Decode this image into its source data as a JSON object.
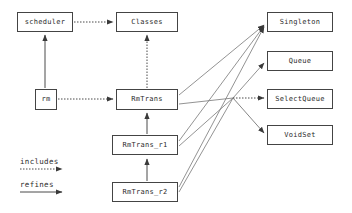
{
  "diagram": {
    "background_color": "#ffffff",
    "line_color": "#4a4a4a",
    "box_border_color": "#444444",
    "text_color": "#2b2b2b",
    "nodes": [
      {
        "id": "scheduler",
        "label": "scheduler",
        "x": 17,
        "y": 12,
        "w": 56,
        "h": 20
      },
      {
        "id": "classes",
        "label": "Classes",
        "x": 116,
        "y": 12,
        "w": 62,
        "h": 20
      },
      {
        "id": "singleton",
        "label": "Singleton",
        "x": 267,
        "y": 12,
        "w": 66,
        "h": 20
      },
      {
        "id": "queue",
        "label": "Queue",
        "x": 267,
        "y": 51,
        "w": 66,
        "h": 20
      },
      {
        "id": "selectqueue",
        "label": "SelectQueue",
        "x": 267,
        "y": 89,
        "w": 66,
        "h": 20
      },
      {
        "id": "voidset",
        "label": "VoidSet",
        "x": 267,
        "y": 125,
        "w": 66,
        "h": 20
      },
      {
        "id": "rm",
        "label": "rm",
        "x": 35,
        "y": 89,
        "w": 22,
        "h": 21
      },
      {
        "id": "rmtrans",
        "label": "RmTrans",
        "x": 116,
        "y": 89,
        "w": 62,
        "h": 21
      },
      {
        "id": "rmtrans_r1",
        "label": "RmTrans_r1",
        "x": 112,
        "y": 135,
        "w": 66,
        "h": 20
      },
      {
        "id": "rmtrans_r2",
        "label": "RmTrans_r2",
        "x": 112,
        "y": 182,
        "w": 66,
        "h": 20
      }
    ],
    "edges": [
      {
        "from": "scheduler",
        "to": "classes",
        "style": "includes"
      },
      {
        "from": "rm",
        "to": "rmtrans",
        "style": "includes"
      },
      {
        "from": "rmtrans",
        "to": "classes",
        "style": "includes"
      },
      {
        "from": "rm",
        "to": "scheduler",
        "style": "refines"
      },
      {
        "from": "rmtrans_r1",
        "to": "rmtrans",
        "style": "refines"
      },
      {
        "from": "rmtrans_r2",
        "to": "rmtrans_r1",
        "style": "refines"
      },
      {
        "from": "rmtrans",
        "to": "singleton",
        "style": "includes"
      },
      {
        "from": "rmtrans_r1",
        "to": "singleton",
        "style": "includes"
      },
      {
        "from": "rmtrans_r2",
        "to": "singleton",
        "style": "includes"
      },
      {
        "from": "hub",
        "to": "queue",
        "style": "includes"
      },
      {
        "from": "hub",
        "to": "selectqueue",
        "style": "includes"
      },
      {
        "from": "hub",
        "to": "voidset",
        "style": "includes"
      }
    ],
    "legend": {
      "includes": {
        "label": "includes",
        "style": "dotted",
        "x": 20,
        "y": 158
      },
      "refines": {
        "label": "refines",
        "style": "solid",
        "x": 20,
        "y": 181
      }
    }
  }
}
